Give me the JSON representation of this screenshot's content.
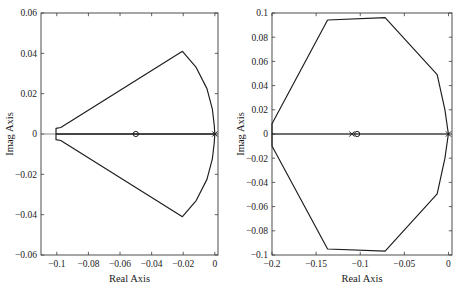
{
  "figure": {
    "background_color": "#ffffff",
    "line_color": "#1c1c1c",
    "axis_color": "#3a3a3a",
    "zero_line_color": "#6b6b6b",
    "width": 458,
    "height": 298
  },
  "chart_data": [
    {
      "type": "line",
      "panel": "left",
      "title": "",
      "xlabel": "Real Axis",
      "ylabel": "Imag Axis",
      "xlim": [
        -0.11,
        0.002
      ],
      "ylim": [
        -0.06,
        0.06
      ],
      "xticks": [
        -0.1,
        -0.08,
        -0.06,
        -0.04,
        -0.02,
        0
      ],
      "xticklabels": [
        "-0.1",
        "-0.08",
        "-0.06",
        "-0.04",
        "-0.02",
        "0"
      ],
      "yticks": [
        -0.06,
        -0.04,
        -0.02,
        0,
        0.02,
        0.04,
        0.06
      ],
      "yticklabels": [
        "-0.06",
        "-0.04",
        "-0.02",
        "0",
        "0.02",
        "0.04",
        "0.06"
      ],
      "grid": false,
      "legend": null,
      "series": [
        {
          "name": "root-locus-contour",
          "kind": "closed-polygon",
          "points": [
            [
              0.0,
              0.0
            ],
            [
              -0.1005,
              0.0
            ],
            [
              -0.1005,
              0.0028
            ],
            [
              -0.0975,
              0.0032
            ],
            [
              -0.0205,
              0.041
            ],
            [
              -0.0118,
              0.033
            ],
            [
              -0.005,
              0.0225
            ],
            [
              -0.0016,
              0.0125
            ],
            [
              -0.0004,
              0.0045
            ],
            [
              0.0,
              0.0
            ],
            [
              -0.0004,
              -0.0045
            ],
            [
              -0.0016,
              -0.0125
            ],
            [
              -0.005,
              -0.0225
            ],
            [
              -0.0118,
              -0.033
            ],
            [
              -0.0205,
              -0.041
            ],
            [
              -0.0975,
              -0.0032
            ],
            [
              -0.1005,
              -0.0028
            ],
            [
              -0.1005,
              0.0
            ]
          ]
        },
        {
          "name": "real-axis-locus-segment",
          "kind": "segment",
          "points": [
            [
              -0.1005,
              0.0
            ],
            [
              0.0,
              0.0
            ]
          ]
        }
      ],
      "markers": [
        {
          "name": "open-loop-zero",
          "symbol": "o",
          "x": -0.05,
          "y": 0.0
        },
        {
          "name": "open-loop-pole",
          "symbol": "x",
          "x": 0.0,
          "y": 0.0
        }
      ]
    },
    {
      "type": "line",
      "panel": "right",
      "title": "",
      "xlabel": "Real Axis",
      "ylabel": "Imag Axis",
      "xlim": [
        -0.2,
        0.004
      ],
      "ylim": [
        -0.1,
        0.1
      ],
      "xticks": [
        -0.2,
        -0.15,
        -0.1,
        -0.05,
        0
      ],
      "xticklabels": [
        "-0.2",
        "-0.15",
        "-0.1",
        "-0.05",
        "0"
      ],
      "yticks": [
        -0.1,
        -0.08,
        -0.06,
        -0.04,
        -0.02,
        0,
        0.02,
        0.04,
        0.06,
        0.08,
        0.1
      ],
      "yticklabels": [
        "-0.1",
        "-0.08",
        "-0.06",
        "-0.04",
        "-0.02",
        "0",
        "0.02",
        "0.04",
        "0.06",
        "0.08",
        "0.1"
      ],
      "grid": false,
      "legend": null,
      "series": [
        {
          "name": "root-locus-contour",
          "kind": "closed-polygon",
          "points": [
            [
              -0.2,
              0.0085
            ],
            [
              -0.137,
              0.0942
            ],
            [
              -0.0718,
              0.0962
            ],
            [
              -0.0128,
              0.049
            ],
            [
              -0.004,
              0.02
            ],
            [
              -0.0008,
              0.0035
            ],
            [
              0.0,
              0.0
            ],
            [
              -0.0008,
              -0.0035
            ],
            [
              -0.004,
              -0.02
            ],
            [
              -0.0128,
              -0.0495
            ],
            [
              -0.0718,
              -0.0968
            ],
            [
              -0.137,
              -0.095
            ],
            [
              -0.2,
              -0.01
            ]
          ]
        },
        {
          "name": "real-axis-locus-segment",
          "kind": "segment",
          "points": [
            [
              -0.2,
              0.0
            ],
            [
              0.0,
              0.0
            ]
          ]
        }
      ],
      "markers": [
        {
          "name": "open-loop-zero",
          "symbol": "o",
          "x": -0.1035,
          "y": 0.0
        },
        {
          "name": "open-loop-pole-inner",
          "symbol": "x",
          "x": -0.1095,
          "y": 0.0
        },
        {
          "name": "open-loop-pole-origin",
          "symbol": "x",
          "x": 0.0,
          "y": 0.0
        }
      ]
    }
  ]
}
